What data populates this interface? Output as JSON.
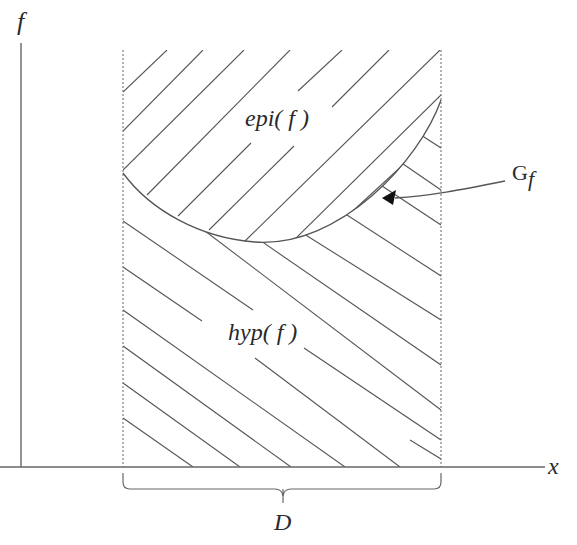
{
  "diagram": {
    "labels": {
      "y_axis": "f",
      "x_axis": "x",
      "epigraph": "epi( f )",
      "hypograph": "hyp( f )",
      "graph_main": "G",
      "graph_sub": "f",
      "domain": "D"
    },
    "colors": {
      "line": "#555555",
      "axis": "#666666",
      "text": "#2a2a2a",
      "background": "#ffffff"
    },
    "regions": [
      {
        "name": "epigraph",
        "hatch_direction": "ascending (/)",
        "position": "above curve"
      },
      {
        "name": "hypograph",
        "hatch_direction": "descending (\\)",
        "position": "below curve"
      }
    ],
    "annotations": [
      {
        "text": "Gf",
        "points_to": "graph of f (curve)"
      }
    ]
  }
}
